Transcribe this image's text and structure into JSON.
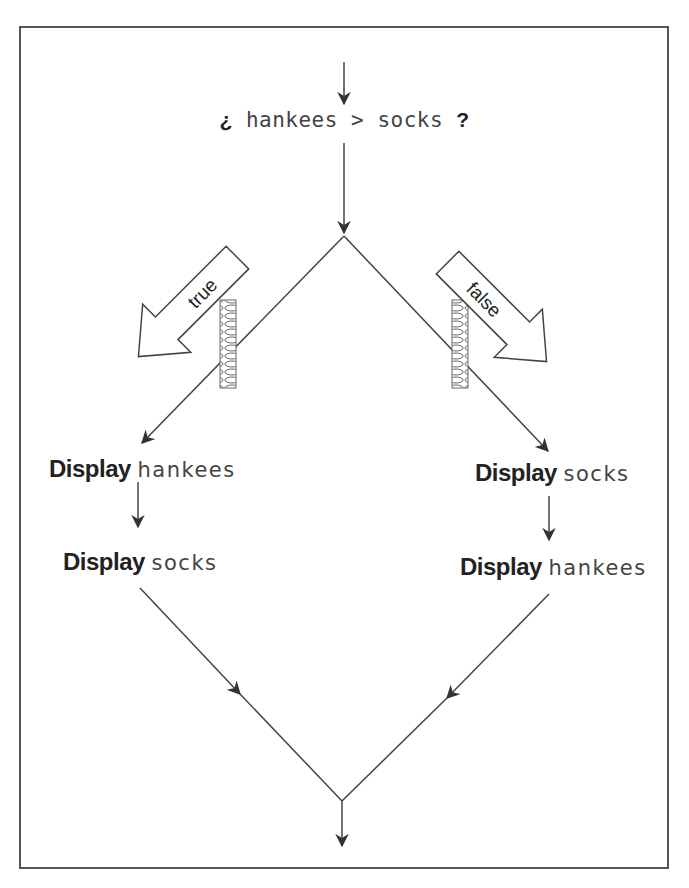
{
  "condition": {
    "open_mark": "¿",
    "left_operand": "hankees",
    "operator": ">",
    "right_operand": "socks",
    "close_mark": "?"
  },
  "branches": {
    "true_label": "true",
    "false_label": "false"
  },
  "left_path": {
    "step1": {
      "keyword": "Display",
      "value": "hankees"
    },
    "step2": {
      "keyword": "Display",
      "value": "socks"
    }
  },
  "right_path": {
    "step1": {
      "keyword": "Display",
      "value": "socks"
    },
    "step2": {
      "keyword": "Display",
      "value": "hankees"
    }
  },
  "colors": {
    "line": "#444444",
    "frame": "#555555",
    "text": "#222222"
  }
}
